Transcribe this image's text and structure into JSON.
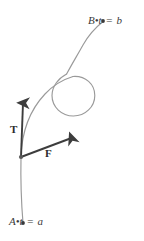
{
  "figure": {
    "type": "parametric-curve-diagram",
    "background_color": "#ffffff",
    "curve_color": "#9a9a9a",
    "vector_color": "#3d3d3d",
    "text_color": "#3a3a3a",
    "width": 144,
    "height": 241
  },
  "endpoints": {
    "start": {
      "point_name": "A",
      "parameter_text": "t = a",
      "dot_marker": "bullet",
      "x": 23,
      "y": 223
    },
    "end": {
      "point_name": "B",
      "parameter_text": "t = b",
      "dot_marker": "bullet",
      "x": 103,
      "y": 21
    }
  },
  "vectors": [
    {
      "label": "T",
      "name": "tangent-vector",
      "origin_x": 21,
      "origin_y": 157,
      "tip_x": 23,
      "tip_y": 100,
      "label_x": 10,
      "label_y": 124
    },
    {
      "label": "F",
      "name": "force-vector",
      "origin_x": 21,
      "origin_y": 157,
      "tip_x": 74,
      "tip_y": 137,
      "label_x": 45,
      "label_y": 148
    }
  ],
  "curve": {
    "description": "looping parametric path from A to B",
    "loop_center_x": 73,
    "loop_center_y": 95,
    "loop_radius": 22
  },
  "symbols": {
    "equals": "=",
    "bullet": "•"
  }
}
